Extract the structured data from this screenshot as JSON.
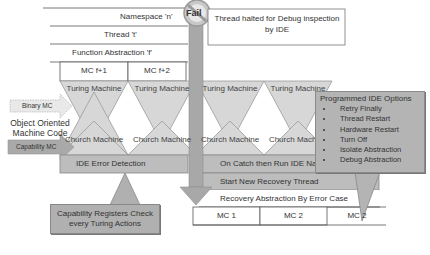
{
  "diagram": {
    "layers": {
      "namespace": "Namespace 'n'",
      "thread": "Thread 't'",
      "function": "Function Abstraction 'f'"
    },
    "mc_cells_top": [
      "MC f+1",
      "MC f+2"
    ],
    "turing_machines": [
      "Turing Machine",
      "Turing Machine",
      "Turing Machine",
      "Turing Machine"
    ],
    "church_machines": [
      "Church Machine",
      "Church Machine",
      "Church Machine",
      "Church Machine"
    ],
    "left_labels": {
      "binary_mc": "Binary MC",
      "oo_machine_code": "Object Oriented Machine Code",
      "capability_mc": "Capability MC"
    },
    "fail_badge": "Fail",
    "halt_note": "Thread halted for Debug inspection by IDE",
    "ide_error_detection": "IDE Error Detection",
    "capability_callout": "Capability Registers Check every Turing Actions",
    "recovery_bands": [
      "On Catch then Run IDE Namespace",
      "Start New Recovery Thread",
      "Recovery Abstraction By Error Case"
    ],
    "mc_cells_bottom": [
      "MC 1",
      "MC 2",
      "MC 2"
    ],
    "ide_options": {
      "title": "Programmed IDE Options",
      "items": [
        "Retry Finally",
        "Thread Restart",
        "Hardware Restart",
        "Turn Off",
        "Isolate Abstraction",
        "Debug Abstraction"
      ]
    },
    "colors": {
      "gray_fill": "#b4b4b4",
      "light_gray": "#d9d9d9",
      "line": "#555555",
      "arrow": "#999999"
    }
  }
}
